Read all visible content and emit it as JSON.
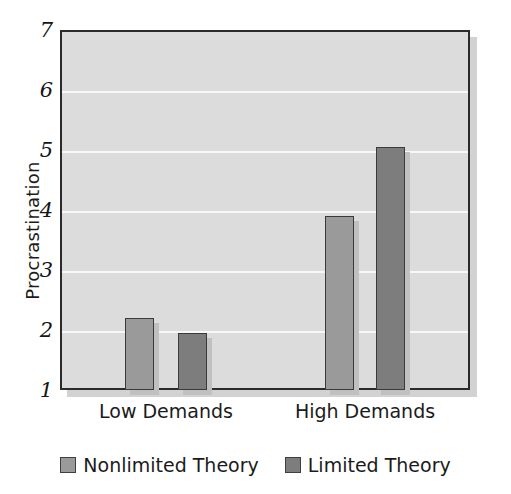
{
  "chart_data": {
    "type": "bar",
    "title": "",
    "xlabel": "",
    "ylabel": "Procrastination",
    "categories": [
      "Low Demands",
      "High Demands"
    ],
    "series": [
      {
        "name": "Nonlimited Theory",
        "values": [
          2.2,
          3.9
        ],
        "color": "#9a9a9a"
      },
      {
        "name": "Limited Theory",
        "values": [
          1.95,
          5.05
        ],
        "color": "#7d7d7d"
      }
    ],
    "ylim": [
      1,
      7
    ],
    "yticks": [
      1,
      2,
      3,
      4,
      5,
      6,
      7
    ],
    "ytick_labels": [
      "1",
      "2",
      "3",
      "4",
      "5",
      "6",
      "7"
    ],
    "grid": true,
    "grid_color": "#f7f7f7",
    "plot_background": "#dcdcdc",
    "axis_color": "#2b2b2b",
    "legend_position": "bottom"
  },
  "axis": {
    "y_title": "Procrastination"
  },
  "legend": {
    "items": [
      {
        "label": "Nonlimited Theory",
        "color": "#9a9a9a"
      },
      {
        "label": "Limited Theory",
        "color": "#7d7d7d"
      }
    ]
  }
}
